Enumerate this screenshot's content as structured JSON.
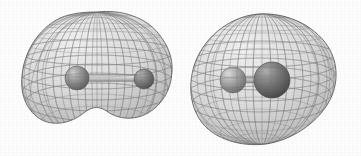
{
  "figure": {
    "width": 361,
    "height": 156,
    "background_color": "#fdfdfd",
    "mesh_color": "#6e6e6e",
    "mesh_color_light": "#9a9a9a",
    "surface_fill": "#d9d9d9",
    "caption": ""
  },
  "molecules": [
    {
      "id": "molecule-left",
      "name": "left-molecule",
      "label": "",
      "surface_shape": "peanut",
      "surface": {
        "center_x": 97,
        "center_y": 78,
        "left_edge_x": 22,
        "right_edge_x": 172,
        "top_edge_y": 12,
        "bottom_edge_y": 143,
        "waist": true,
        "fill": "#dcdcdc",
        "mesh_color": "#686868"
      },
      "atoms": [
        {
          "id": "left-atom-1",
          "name": "atom-sphere-large",
          "cx": 77,
          "cy": 78,
          "r": 12,
          "color": "#8f8f8f",
          "highlight_color": "#c9c9c9",
          "shadow_color": "#5b5b5b"
        },
        {
          "id": "left-atom-2",
          "name": "atom-sphere-small",
          "cx": 144,
          "cy": 79,
          "r": 10,
          "color": "#7d7d7d",
          "highlight_color": "#b5b5b5",
          "shadow_color": "#4e4e4e"
        }
      ],
      "bond": {
        "id": "left-bond",
        "name": "bond-cylinder",
        "x1": 77,
        "y1": 78,
        "x2": 144,
        "y2": 79,
        "width": 7,
        "color": "#c7c7c7",
        "edge_color": "#8a8a8a",
        "style": "cylinder"
      }
    },
    {
      "id": "molecule-right",
      "name": "right-molecule",
      "label": "",
      "surface_shape": "ovoid",
      "surface": {
        "center_x": 256,
        "center_y": 79,
        "left_edge_x": 190,
        "right_edge_x": 336,
        "top_edge_y": 14,
        "bottom_edge_y": 144,
        "waist": false,
        "fill": "#dcdcdc",
        "mesh_color": "#686868"
      },
      "atoms": [
        {
          "id": "right-atom-1",
          "name": "atom-sphere-small",
          "cx": 233,
          "cy": 80,
          "r": 13,
          "color": "#a2a2a2",
          "highlight_color": "#d2d2d2",
          "shadow_color": "#6a6a6a"
        },
        {
          "id": "right-atom-2",
          "name": "atom-sphere-large",
          "cx": 272,
          "cy": 80,
          "r": 18,
          "color": "#777777",
          "highlight_color": "#a8a8a8",
          "shadow_color": "#474747"
        }
      ],
      "bond": {
        "id": "right-bond",
        "name": "bond-cylinder",
        "x1": 233,
        "y1": 80,
        "x2": 272,
        "y2": 80,
        "width": 6,
        "color": "#b8b8b8",
        "edge_color": "#868686",
        "style": "cylinder"
      }
    }
  ],
  "mesh": {
    "longitude_count": 30,
    "latitude_count": 22,
    "stroke_width": 0.55,
    "opacity": 0.85
  }
}
